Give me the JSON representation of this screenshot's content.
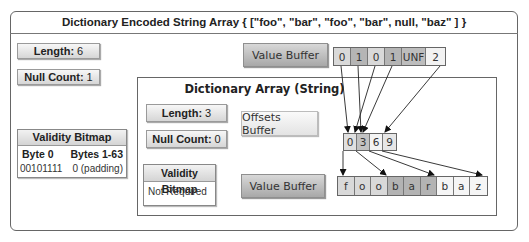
{
  "title": "Dictionary Encoded String Array { [\"foo\", \"bar\", \"foo\", \"bar\", null, \"baz\" ] }",
  "outer": {
    "length_label": "Length:",
    "length_value": "6",
    "null_count_label": "Null Count:",
    "null_count_value": "1",
    "validity_bitmap": {
      "header": "Validity Bitmap",
      "columns": [
        "Byte 0",
        "Bytes 1-63"
      ],
      "values": [
        "00101111",
        "0 (padding)"
      ]
    },
    "value_buffer": {
      "label": "Value Buffer",
      "cells": [
        {
          "text": "0",
          "shade": "#d9d9d9"
        },
        {
          "text": "1",
          "shade": "#b5b5b5"
        },
        {
          "text": "0",
          "shade": "#d9d9d9"
        },
        {
          "text": "1",
          "shade": "#b5b5b5"
        },
        {
          "text": "UNF",
          "shade": "#bdbdbd"
        },
        {
          "text": "2",
          "shade": "#f2f2f2"
        }
      ]
    }
  },
  "dictionary": {
    "title": "Dictionary Array (String)",
    "length_label": "Length:",
    "length_value": "3",
    "null_count_label": "Null Count:",
    "null_count_value": "0",
    "validity_bitmap": {
      "header": "Validity Bitmap",
      "value": "Not Required"
    },
    "offsets_buffer": {
      "label": "Offsets Buffer",
      "cells": [
        {
          "text": "0",
          "shade": "#e0e0e0"
        },
        {
          "text": "3",
          "shade": "#c2c2c2"
        },
        {
          "text": "6",
          "shade": "#f4f4f4"
        },
        {
          "text": "9",
          "shade": "#e6e6e6"
        }
      ]
    },
    "value_buffer": {
      "label": "Value Buffer",
      "cells": [
        {
          "text": "f",
          "shade": "#d9d9d9"
        },
        {
          "text": "o",
          "shade": "#d9d9d9"
        },
        {
          "text": "o",
          "shade": "#d9d9d9"
        },
        {
          "text": "b",
          "shade": "#b3b3b3"
        },
        {
          "text": "a",
          "shade": "#b3b3b3"
        },
        {
          "text": "r",
          "shade": "#b3b3b3"
        },
        {
          "text": "b",
          "shade": "#f5f5f5"
        },
        {
          "text": "a",
          "shade": "#f5f5f5"
        },
        {
          "text": "z",
          "shade": "#f5f5f5"
        }
      ]
    }
  }
}
